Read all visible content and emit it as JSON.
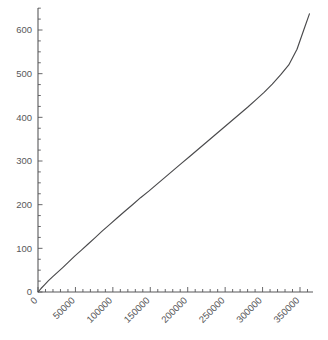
{
  "chart_data": {
    "type": "line",
    "title": "",
    "subtitle": "",
    "xlabel": "",
    "ylabel": "",
    "xlim": [
      0,
      370000
    ],
    "ylim": [
      0,
      650
    ],
    "grid": false,
    "legend": null,
    "x_ticks": [
      0,
      50000,
      100000,
      150000,
      200000,
      250000,
      300000,
      350000
    ],
    "x_tick_labels": [
      "0",
      "50000",
      "100000",
      "150000",
      "200000",
      "250000",
      "300000",
      "350000"
    ],
    "x_minor_tick_step": 10000,
    "y_ticks": [
      0,
      100,
      200,
      300,
      400,
      500,
      600
    ],
    "y_tick_labels": [
      "0",
      "100",
      "200",
      "300",
      "400",
      "500",
      "600"
    ],
    "y_minor_tick_step": 25,
    "x_tick_label_rotation": -45,
    "series": [
      {
        "name": "series-1",
        "color": "#4a4a4c",
        "x": [
          0,
          4000,
          9000,
          14000,
          19000,
          26000,
          33000,
          41000,
          49000,
          58000,
          67000,
          76000,
          86000,
          96000,
          106000,
          116000,
          127000,
          137000,
          148000,
          159000,
          170000,
          181000,
          192000,
          203000,
          214000,
          225000,
          236000,
          247000,
          258000,
          269000,
          280000,
          291000,
          302000,
          313000,
          324000,
          335000,
          346000,
          355000,
          362600
        ],
        "y": [
          0,
          8,
          17,
          26,
          34,
          45,
          56,
          69,
          82,
          96,
          110,
          124,
          140,
          155,
          170,
          185,
          201,
          216,
          231,
          247,
          263,
          279,
          295,
          311,
          327,
          343,
          359,
          375,
          391,
          407,
          423,
          440,
          457,
          476,
          497,
          520,
          556,
          600,
          637
        ]
      }
    ]
  },
  "colors": {
    "background": "#ffffff",
    "axis": "#58585a",
    "series": "#4a4a4c",
    "tick_label": "#58585a"
  }
}
